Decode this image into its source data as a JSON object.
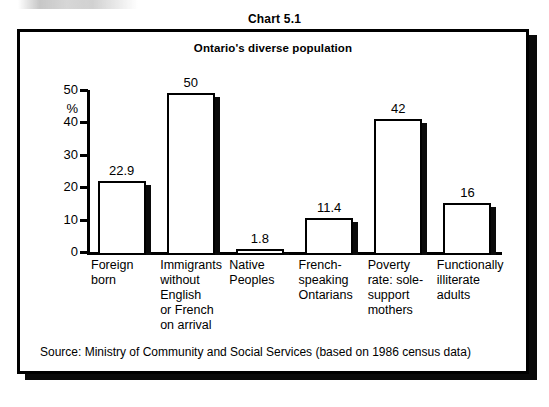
{
  "chart_number": "Chart 5.1",
  "source_note": "Source: Ministry of Community and Social Services (based on 1986 census data)",
  "chart_data": {
    "type": "bar",
    "title": "Ontario's diverse population",
    "xlabel": "",
    "ylabel": "%",
    "ylim": [
      0,
      50
    ],
    "yticks": [
      0,
      10,
      20,
      30,
      40,
      50
    ],
    "grid": false,
    "legend": "none",
    "categories": [
      "Foreign born",
      "Immigrants without English or French on arrival",
      "Native Peoples",
      "French-speaking Ontarians",
      "Poverty rate: sole-support mothers",
      "Functionally illiterate adults"
    ],
    "category_lines": [
      [
        "Foreign",
        "born"
      ],
      [
        "Immigrants",
        "without",
        "English",
        "or French",
        "on arrival"
      ],
      [
        "Native",
        "Peoples"
      ],
      [
        "French-",
        "speaking",
        "Ontarians"
      ],
      [
        "Poverty",
        "rate: sole-",
        "support",
        "mothers"
      ],
      [
        "Functionally",
        "illiterate",
        "adults"
      ]
    ],
    "values": [
      22.9,
      50,
      1.8,
      11.4,
      42,
      16
    ],
    "value_labels": [
      "22.9",
      "50",
      "1.8",
      "11.4",
      "42",
      "16"
    ],
    "colors": {
      "bar_fill": "#ffffff",
      "bar_outline": "#000000",
      "bar_shadow": "#0a0a0a",
      "axis": "#000000",
      "text": "#000000",
      "background": "#ffffff"
    }
  }
}
